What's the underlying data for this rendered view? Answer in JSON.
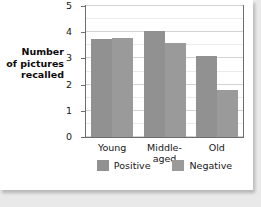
{
  "chart_data": {
    "type": "bar",
    "title": "",
    "xlabel": "",
    "ylabel": "Number\nof pictures\nrecalled",
    "categories": [
      "Young",
      "Middle-aged",
      "Old"
    ],
    "series": [
      {
        "name": "Positive",
        "values": [
          3.75,
          4.05,
          3.1
        ],
        "color": "#919191"
      },
      {
        "name": "Negative",
        "values": [
          3.78,
          3.6,
          1.8
        ],
        "color": "#9a9a9a"
      }
    ],
    "ylim": [
      0,
      5
    ],
    "yticks": [
      "0",
      "1",
      "2",
      "3",
      "4",
      "5"
    ],
    "grid": true,
    "minor_gridlines": true,
    "legend_position": "bottom"
  },
  "colors": {
    "positive": "#919191",
    "negative": "#9a9a9a",
    "plot_border": "#6d6d6d",
    "gridline": "#d2d2d2",
    "page_background": "#e9e9e9",
    "card_background": "#ffffff"
  }
}
